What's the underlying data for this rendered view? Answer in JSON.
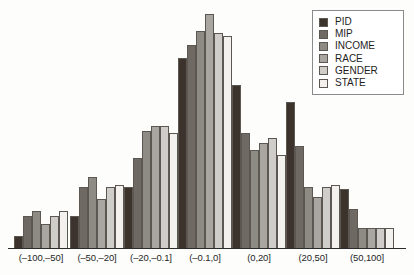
{
  "chart_data": {
    "type": "bar",
    "title": "",
    "subtitle": "",
    "xlabel": "",
    "ylabel": "",
    "grid": false,
    "legend_position": "top-right",
    "ylim": [
      0,
      100
    ],
    "categories": [
      "(–100,–50]",
      "(–50,–20]",
      "(–20,–0.1]",
      "(–0.1,0]",
      "(0,20]",
      "(20,50]",
      "(50,100]"
    ],
    "series": [
      {
        "name": "PID",
        "color": "#3b332c",
        "values": [
          5,
          13,
          25,
          78,
          67,
          60,
          24
        ]
      },
      {
        "name": "MIP",
        "color": "#6e6a63",
        "values": [
          13,
          25,
          37,
          83,
          47,
          42,
          16
        ]
      },
      {
        "name": "INCOME",
        "color": "#8e8b85",
        "values": [
          15,
          29,
          48,
          89,
          40,
          25,
          8
        ]
      },
      {
        "name": "RACE",
        "color": "#a9a6a1",
        "values": [
          10,
          20,
          50,
          96,
          43,
          21,
          8
        ]
      },
      {
        "name": "GENDER",
        "color": "#cfcdc9",
        "values": [
          13,
          25,
          50,
          88,
          45,
          25,
          8
        ]
      },
      {
        "name": "STATE",
        "color": "#f2f1ee",
        "values": [
          15,
          26,
          47,
          87,
          38,
          26,
          8
        ]
      }
    ]
  },
  "legend": {
    "items": [
      {
        "label": "PID"
      },
      {
        "label": "MIP"
      },
      {
        "label": "INCOME"
      },
      {
        "label": "RACE"
      },
      {
        "label": "GENDER"
      },
      {
        "label": "STATE"
      }
    ]
  }
}
